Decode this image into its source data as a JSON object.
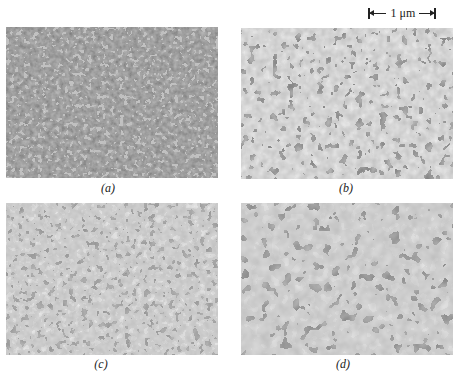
{
  "figure": {
    "scale_bar": {
      "label": "1 μm"
    },
    "panels": [
      {
        "id": "a",
        "label": "(a)",
        "description": "fine, dense dark interconnected microstructure"
      },
      {
        "id": "b",
        "label": "(b)",
        "description": "coarser dark phase on light matrix"
      },
      {
        "id": "c",
        "label": "(c)",
        "description": "interconnected worm-like structure, mixed contrast"
      },
      {
        "id": "d",
        "label": "(d)",
        "description": "coarsest interconnected spinodal-like structure"
      }
    ]
  },
  "colors": {
    "background": "#ffffff",
    "dark_phase": "#2a2a2a",
    "light_phase": "#e0e0e0",
    "text": "#222222"
  }
}
